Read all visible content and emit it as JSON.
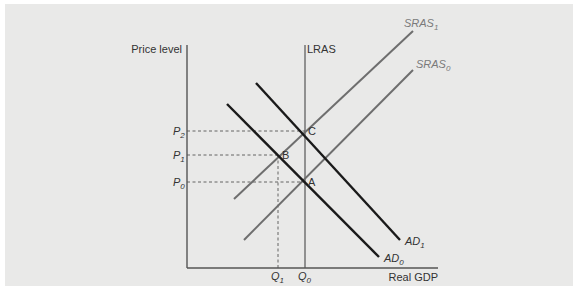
{
  "diagram": {
    "type": "AD-AS model",
    "y_axis_label": "Price level",
    "x_axis_label": "Real GDP",
    "lras_label": "LRAS",
    "curves": [
      {
        "name": "AD0",
        "label_base": "AD",
        "label_sub": "0",
        "kind": "aggregate demand",
        "color": "#1a1a1a"
      },
      {
        "name": "AD1",
        "label_base": "AD",
        "label_sub": "1",
        "kind": "aggregate demand",
        "color": "#1a1a1a"
      },
      {
        "name": "SRAS0",
        "label_base": "SRAS",
        "label_sub": "0",
        "kind": "short-run aggregate supply",
        "color": "#6e6e6e"
      },
      {
        "name": "SRAS1",
        "label_base": "SRAS",
        "label_sub": "1",
        "kind": "short-run aggregate supply",
        "color": "#6e6e6e"
      },
      {
        "name": "LRAS",
        "label_base": "LRAS",
        "label_sub": "",
        "kind": "long-run aggregate supply",
        "color": "#555555"
      }
    ],
    "points": [
      {
        "label": "A",
        "price": "P0",
        "quantity": "Q0"
      },
      {
        "label": "B",
        "price": "P1",
        "quantity": "Q1"
      },
      {
        "label": "C",
        "price": "P2",
        "quantity": "Q0"
      }
    ],
    "price_ticks": [
      {
        "base": "P",
        "sub": "2"
      },
      {
        "base": "P",
        "sub": "1"
      },
      {
        "base": "P",
        "sub": "0"
      }
    ],
    "quantity_ticks": [
      {
        "base": "Q",
        "sub": "1"
      },
      {
        "base": "Q",
        "sub": "0"
      }
    ],
    "colors": {
      "panel_background": "#e9e9e8",
      "ad_lines": "#1a1a1a",
      "sras_lines": "#6e6e6e",
      "axes": "#555555",
      "guides": "#555555"
    }
  }
}
